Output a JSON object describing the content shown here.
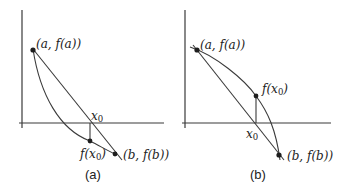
{
  "figure": {
    "panels": [
      {
        "id": "a",
        "caption": "(a)",
        "labels": {
          "point_a": "(a, f(a))",
          "point_b": "(b, f(b))",
          "x0": "x",
          "x0_sub": "0",
          "fx0_prefix": "f(x",
          "fx0_sub": "0",
          "fx0_suffix": ")"
        },
        "description": "Convex decreasing curve below chord; f(x0) lies below x-axis"
      },
      {
        "id": "b",
        "caption": "(b)",
        "labels": {
          "point_a": "(a, f(a))",
          "point_b": "(b, f(b))",
          "x0": "x",
          "x0_sub": "0",
          "fx0_prefix": "f(x",
          "fx0_sub": "0",
          "fx0_suffix": ")"
        },
        "description": "Concave decreasing curve above chord; f(x0) lies above x-axis"
      }
    ]
  }
}
